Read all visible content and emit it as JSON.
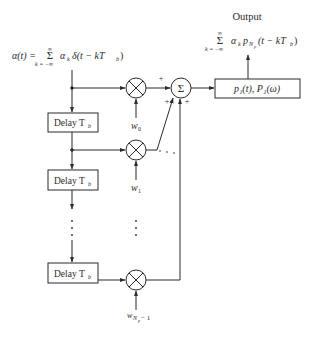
{
  "title": "Output",
  "input_expr": {
    "lhs": "α(t) =",
    "sum_symbol": "Σ",
    "sum_upper": "∞",
    "sum_lower": "k = −∞",
    "term": "α",
    "term_sub": "k",
    "delta": "δ(t − kT",
    "delta_sub": "b",
    "close": ")"
  },
  "output_expr": {
    "sum_symbol": "Σ",
    "sum_upper": "∞",
    "sum_lower": "k = −∞",
    "term": "α",
    "term_sub": "k",
    "p": "p",
    "p_sub": "N",
    "p_subsub": "p",
    "arg": "(t − kT",
    "arg_sub": "b",
    "close": ")"
  },
  "filter_box": {
    "label": "p₁(t), P₁(ω)"
  },
  "sum_node": {
    "symbol": "Σ",
    "signs": [
      "+",
      "+",
      "+"
    ]
  },
  "delay_boxes": [
    {
      "label": "Delay T",
      "sub": "b"
    },
    {
      "label": "Delay T",
      "sub": "b"
    },
    {
      "label": "Delay T",
      "sub": "b"
    }
  ],
  "weights": [
    {
      "label": "w",
      "sub": "0"
    },
    {
      "label": "w",
      "sub": "1"
    },
    {
      "label": "w",
      "sub": "N",
      "subsub": "p",
      "suffix": " − 1"
    }
  ],
  "ellipsis": "· · ·"
}
